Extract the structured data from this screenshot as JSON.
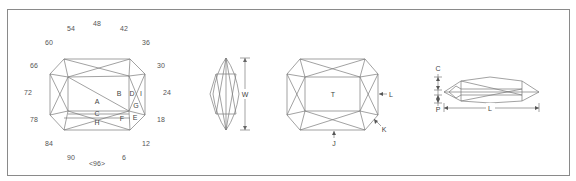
{
  "diagram": {
    "index_dial": {
      "labels": [
        "48",
        "42",
        "36",
        "30",
        "24",
        "18",
        "12",
        "6",
        "<96>",
        "90",
        "84",
        "78",
        "72",
        "66",
        "60",
        "54"
      ]
    },
    "pavilion_view": {
      "facet_labels": [
        "A",
        "B",
        "C",
        "D",
        "E",
        "F",
        "G",
        "H",
        "I"
      ]
    },
    "end_view": {
      "dimension_label": "W"
    },
    "crown_view": {
      "facet_labels": [
        "T",
        "J",
        "K",
        "L"
      ]
    },
    "side_view": {
      "dimension_labels": [
        "C",
        "P",
        "L"
      ]
    },
    "colors": {
      "line": "#7a7a7a",
      "text": "#555555",
      "frame": "#8a8a8a"
    }
  }
}
